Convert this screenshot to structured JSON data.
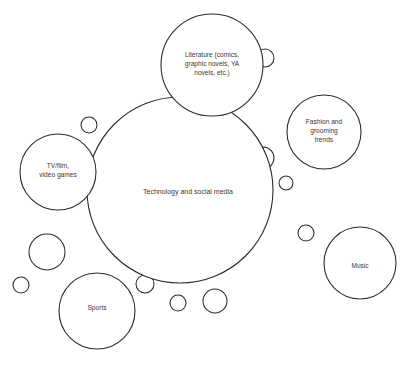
{
  "diagram": {
    "type": "bubble-diagram",
    "title_visible": false,
    "background_color": "#ffffff",
    "stroke_color": "#2b2b2b",
    "text_color": "#3a3a3a",
    "labeled_bubbles": [
      {
        "id": "technology-and-social-media",
        "label": "Technology and social media",
        "lines": [
          "Technology and social media"
        ],
        "cx": 180,
        "cy": 190,
        "r": 93,
        "label_x": 188,
        "label_y": 192
      },
      {
        "id": "literature",
        "label": "Literature (comics, graphic novels, YA novels, etc.)",
        "lines": [
          "Literature (comics,",
          "graphic novels, YA",
          "novels, etc.)"
        ],
        "cx": 212,
        "cy": 65,
        "r": 51,
        "label_x": 212,
        "label_y": 64
      },
      {
        "id": "tv-film-video-games",
        "label": "TV/film, video games",
        "lines": [
          "TV/film,",
          "video games"
        ],
        "cx": 58,
        "cy": 172,
        "r": 38,
        "label_x": 58,
        "label_y": 170
      },
      {
        "id": "fashion-and-grooming-trends",
        "label": "Fashion and grooming trends",
        "lines": [
          "Fashion and",
          "grooming",
          "trends"
        ],
        "cx": 324,
        "cy": 132,
        "r": 37,
        "label_x": 324,
        "label_y": 131
      },
      {
        "id": "music",
        "label": "Music",
        "lines": [
          "Music"
        ],
        "cx": 360,
        "cy": 263,
        "r": 36,
        "label_x": 360,
        "label_y": 266
      },
      {
        "id": "sports",
        "label": "Sports",
        "lines": [
          "Sports"
        ],
        "cx": 97,
        "cy": 311,
        "r": 38,
        "label_x": 97,
        "label_y": 308
      }
    ],
    "unlabeled_bubbles": [
      {
        "id": "bubble-1",
        "cx": 265,
        "cy": 58,
        "r": 9
      },
      {
        "id": "bubble-2",
        "cx": 89,
        "cy": 125,
        "r": 8
      },
      {
        "id": "bubble-3",
        "cx": 148,
        "cy": 127,
        "r": 8
      },
      {
        "id": "bubble-4",
        "cx": 176,
        "cy": 128,
        "r": 11
      },
      {
        "id": "bubble-5",
        "cx": 263,
        "cy": 158,
        "r": 11
      },
      {
        "id": "bubble-6",
        "cx": 286,
        "cy": 183,
        "r": 7
      },
      {
        "id": "bubble-7",
        "cx": 102,
        "cy": 214,
        "r": 9
      },
      {
        "id": "bubble-8",
        "cx": 306,
        "cy": 233,
        "r": 8
      },
      {
        "id": "bubble-9",
        "cx": 47,
        "cy": 252,
        "r": 18
      },
      {
        "id": "bubble-10",
        "cx": 173,
        "cy": 265,
        "r": 9
      },
      {
        "id": "bubble-11",
        "cx": 145,
        "cy": 284,
        "r": 9
      },
      {
        "id": "bubble-12",
        "cx": 21,
        "cy": 285,
        "r": 8
      },
      {
        "id": "bubble-13",
        "cx": 178,
        "cy": 303,
        "r": 8
      },
      {
        "id": "bubble-14",
        "cx": 215,
        "cy": 301,
        "r": 12
      }
    ]
  }
}
